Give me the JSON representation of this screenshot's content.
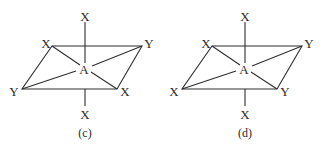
{
  "panels": [
    {
      "caption": "(c)",
      "center": "A",
      "top": "X",
      "bottom": "X",
      "corner_top_left": "X",
      "corner_top_right": "Y",
      "corner_bottom_left": "Y",
      "corner_bottom_right": "X"
    },
    {
      "caption": "(d)",
      "center": "A",
      "top": "X",
      "bottom": "X",
      "corner_top_left": "X",
      "corner_top_right": "Y",
      "corner_bottom_left": "X",
      "corner_bottom_right": "Y"
    }
  ]
}
